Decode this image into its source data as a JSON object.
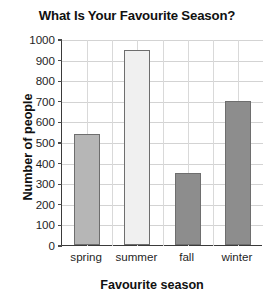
{
  "chart_data": {
    "type": "bar",
    "title": "What Is Your Favourite Season?",
    "xlabel": "Favourite season",
    "ylabel": "Number of people",
    "categories": [
      "spring",
      "summer",
      "fall",
      "winter"
    ],
    "values": [
      540,
      945,
      350,
      700
    ],
    "ylim": [
      0,
      1000
    ],
    "ytick_labels": [
      "1000",
      "900",
      "800",
      "700",
      "600",
      "500",
      "400",
      "300",
      "200",
      "100",
      "0"
    ],
    "ytick_values": [
      1000,
      900,
      800,
      700,
      600,
      500,
      400,
      300,
      200,
      100,
      0
    ],
    "ytick_step": 100,
    "grid": true,
    "legend": false,
    "bar_colors": [
      "#b6b6b6",
      "#f0f0f0",
      "#8d8d8d",
      "#8d8d8d"
    ],
    "bar_edge_color": "#6e6e6e",
    "axis_color": "#3a3a3a",
    "grid_color": "#d3d3d3",
    "background_color": "#ffffff",
    "series": [
      {
        "name": "Number of people",
        "values": [
          540,
          945,
          350,
          700
        ]
      }
    ]
  }
}
